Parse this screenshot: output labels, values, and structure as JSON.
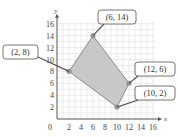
{
  "chart_data": {
    "type": "scatter",
    "title": "",
    "xlabel": "x",
    "ylabel": "y",
    "xlim": [
      0,
      16
    ],
    "ylim": [
      0,
      16
    ],
    "grid": true,
    "x_ticks": [
      "0",
      "2",
      "4",
      "6",
      "8",
      "10",
      "12",
      "14",
      "16"
    ],
    "y_ticks": [
      "2",
      "4",
      "6",
      "8",
      "10",
      "12",
      "14",
      "16"
    ],
    "polygon": {
      "fill": "#c8c8c8",
      "vertices": [
        {
          "x": 2,
          "y": 8,
          "label": "(2, 8)"
        },
        {
          "x": 6,
          "y": 14,
          "label": "(6, 14)"
        },
        {
          "x": 12,
          "y": 6,
          "label": "(12, 6)"
        },
        {
          "x": 10,
          "y": 2,
          "label": "(10, 2)"
        }
      ]
    },
    "colors": {
      "axis": "#555555",
      "grid": "#e2e2e2",
      "region": "#c8c8c8",
      "edge": "#8a8a8a",
      "vertex": "#999999"
    }
  }
}
